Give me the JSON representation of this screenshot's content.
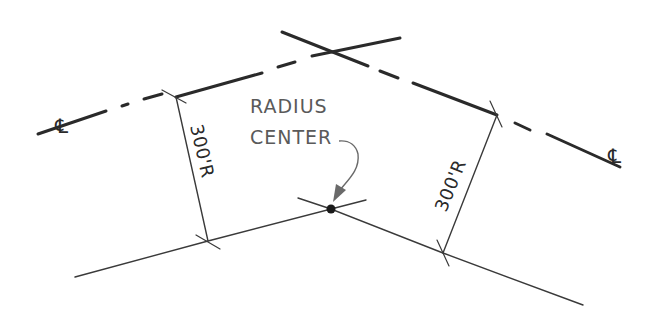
{
  "drawing": {
    "type": "horizontal-curve-layout",
    "labels": {
      "radius_center_line1": "RADIUS",
      "radius_center_line2": "CENTER",
      "left_radius": "300'R",
      "right_radius": "300'R",
      "left_centerline_symbol": "℄",
      "right_centerline_symbol": "℄"
    },
    "colors": {
      "background": "#ffffff",
      "line": "#2a2a2a",
      "label": "#5a5a5a"
    }
  }
}
